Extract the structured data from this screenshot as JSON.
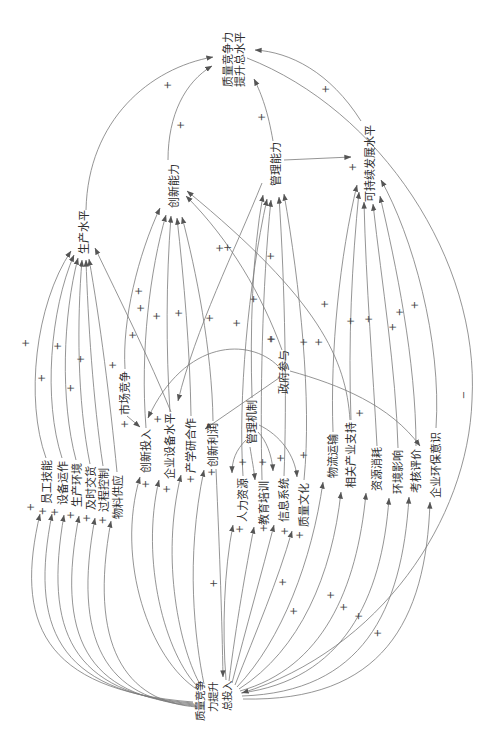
{
  "diagram": {
    "type": "causal-loop-diagram",
    "orientation": "rotated 90 degrees counter-clockwise",
    "nodes": {
      "total_level": {
        "label": "质量竞争力提升总水平",
        "lines": [
          "质量竞争力",
          "提升总水平"
        ]
      },
      "total_input": {
        "label": "质量竞争力提升总投入",
        "lines": [
          "质量竞争",
          "力提升",
          "总投入"
        ]
      },
      "production_level": {
        "label": "生产水平"
      },
      "innovation_capability": {
        "label": "创新能力"
      },
      "management_capability": {
        "label": "管理能力"
      },
      "sustainability_level": {
        "label": "可持续发展水平"
      },
      "employee_skill": {
        "label": "员工技能"
      },
      "equipment_operation": {
        "label": "设备运作"
      },
      "production_environment": {
        "label": "生产环境"
      },
      "on_time_delivery": {
        "label": "及时交货"
      },
      "process_control": {
        "label": "过程控制"
      },
      "material_supply": {
        "label": "物料供应"
      },
      "market_competition": {
        "label": "市场竞争"
      },
      "innovation_input": {
        "label": "创新投入"
      },
      "equipment_level": {
        "label": "企业设备水平"
      },
      "iur_cooperation": {
        "label": "产学研合作"
      },
      "innovation_profit": {
        "label": "创新利润"
      },
      "management_mechanism": {
        "label": "管理机制"
      },
      "government_participation": {
        "label": "政府参与"
      },
      "human_resources": {
        "label": "人力资源"
      },
      "education_training": {
        "label": "教育培训"
      },
      "information_system": {
        "label": "信息系统"
      },
      "quality_culture": {
        "label": "质量文化"
      },
      "logistics": {
        "label": "物流运输"
      },
      "industry_support": {
        "label": "相关产业支持"
      },
      "resource_consumption": {
        "label": "资源消耗"
      },
      "environmental_impact": {
        "label": "环境影响"
      },
      "assessment": {
        "label": "考核评价"
      },
      "env_awareness": {
        "label": "企业环保意识"
      }
    },
    "edges": [
      {
        "from": "total_input",
        "to": "employee_skill",
        "polarity": "+"
      },
      {
        "from": "total_input",
        "to": "equipment_operation",
        "polarity": "+"
      },
      {
        "from": "total_input",
        "to": "production_environment",
        "polarity": "+"
      },
      {
        "from": "total_input",
        "to": "on_time_delivery",
        "polarity": "+"
      },
      {
        "from": "total_input",
        "to": "process_control",
        "polarity": "+"
      },
      {
        "from": "total_input",
        "to": "material_supply",
        "polarity": "+"
      },
      {
        "from": "total_input",
        "to": "innovation_input",
        "polarity": "+"
      },
      {
        "from": "total_input",
        "to": "equipment_level",
        "polarity": "+"
      },
      {
        "from": "total_input",
        "to": "iur_cooperation",
        "polarity": "+"
      },
      {
        "from": "total_input",
        "to": "innovation_profit",
        "polarity": "+"
      },
      {
        "from": "total_input",
        "to": "human_resources",
        "polarity": "+"
      },
      {
        "from": "total_input",
        "to": "education_training",
        "polarity": "+"
      },
      {
        "from": "total_input",
        "to": "information_system",
        "polarity": "+"
      },
      {
        "from": "total_input",
        "to": "quality_culture",
        "polarity": "+"
      },
      {
        "from": "total_input",
        "to": "logistics",
        "polarity": "+"
      },
      {
        "from": "total_input",
        "to": "industry_support",
        "polarity": "+"
      },
      {
        "from": "total_input",
        "to": "resource_consumption",
        "polarity": "+"
      },
      {
        "from": "total_input",
        "to": "environmental_impact",
        "polarity": "+"
      },
      {
        "from": "total_input",
        "to": "assessment",
        "polarity": "+"
      },
      {
        "from": "total_input",
        "to": "env_awareness",
        "polarity": "+"
      },
      {
        "from": "employee_skill",
        "to": "production_level",
        "polarity": "+"
      },
      {
        "from": "equipment_operation",
        "to": "production_level",
        "polarity": "+"
      },
      {
        "from": "production_environment",
        "to": "production_level",
        "polarity": "+"
      },
      {
        "from": "on_time_delivery",
        "to": "production_level",
        "polarity": "+"
      },
      {
        "from": "process_control",
        "to": "production_level",
        "polarity": "+"
      },
      {
        "from": "material_supply",
        "to": "production_level",
        "polarity": "+"
      },
      {
        "from": "equipment_level",
        "to": "production_level",
        "polarity": "+"
      },
      {
        "from": "market_competition",
        "to": "innovation_capability",
        "polarity": "+"
      },
      {
        "from": "innovation_input",
        "to": "innovation_capability",
        "polarity": "+"
      },
      {
        "from": "equipment_level",
        "to": "innovation_capability",
        "polarity": "+"
      },
      {
        "from": "iur_cooperation",
        "to": "innovation_capability",
        "polarity": "+"
      },
      {
        "from": "innovation_profit",
        "to": "innovation_capability",
        "polarity": "+"
      },
      {
        "from": "government_participation",
        "to": "innovation_capability",
        "polarity": "+"
      },
      {
        "from": "industry_support",
        "to": "innovation_capability",
        "polarity": "+"
      },
      {
        "from": "management_mechanism",
        "to": "management_capability",
        "polarity": "+"
      },
      {
        "from": "human_resources",
        "to": "management_capability",
        "polarity": "+"
      },
      {
        "from": "education_training",
        "to": "management_capability",
        "polarity": "+"
      },
      {
        "from": "information_system",
        "to": "management_capability",
        "polarity": "+"
      },
      {
        "from": "quality_culture",
        "to": "management_capability",
        "polarity": "+"
      },
      {
        "from": "management_capability",
        "to": "equipment_level",
        "polarity": "+"
      },
      {
        "from": "logistics",
        "to": "sustainability_level",
        "polarity": "+"
      },
      {
        "from": "industry_support",
        "to": "sustainability_level",
        "polarity": "+"
      },
      {
        "from": "resource_consumption",
        "to": "sustainability_level",
        "polarity": "+"
      },
      {
        "from": "environmental_impact",
        "to": "sustainability_level",
        "polarity": "+"
      },
      {
        "from": "assessment",
        "to": "sustainability_level",
        "polarity": "+"
      },
      {
        "from": "env_awareness",
        "to": "sustainability_level",
        "polarity": "+"
      },
      {
        "from": "management_capability",
        "to": "sustainability_level",
        "polarity": "+"
      },
      {
        "from": "production_level",
        "to": "total_level",
        "polarity": "+"
      },
      {
        "from": "innovation_capability",
        "to": "total_level",
        "polarity": "+"
      },
      {
        "from": "management_capability",
        "to": "total_level",
        "polarity": "+"
      },
      {
        "from": "sustainability_level",
        "to": "total_level",
        "polarity": "+"
      },
      {
        "from": "total_level",
        "to": "total_input",
        "polarity": "−"
      },
      {
        "from": "market_competition",
        "to": "innovation_input",
        "polarity": "+"
      },
      {
        "from": "government_participation",
        "to": "innovation_input",
        "polarity": "+"
      },
      {
        "from": "government_participation",
        "to": "innovation_profit",
        "polarity": "+"
      },
      {
        "from": "government_participation",
        "to": "assessment",
        "polarity": "+"
      },
      {
        "from": "management_mechanism",
        "to": "human_resources",
        "polarity": "+"
      },
      {
        "from": "management_mechanism",
        "to": "education_training",
        "polarity": "+"
      },
      {
        "from": "management_mechanism",
        "to": "information_system",
        "polarity": "+"
      },
      {
        "from": "management_mechanism",
        "to": "quality_culture",
        "polarity": "+"
      },
      {
        "from": "innovation_profit",
        "to": "total_input",
        "polarity": "+"
      }
    ]
  }
}
